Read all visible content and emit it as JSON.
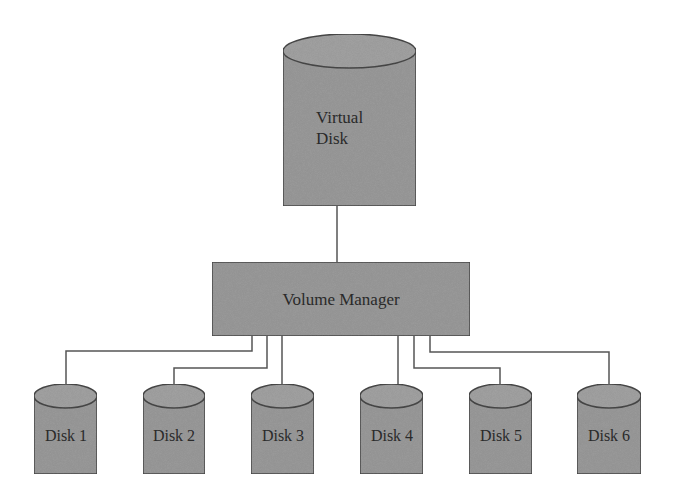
{
  "diagram": {
    "type": "storage-virtualization",
    "colors": {
      "fill": "#9c9c9c",
      "stroke": "#4a4a4a",
      "line": "#555555",
      "text": "#2a2a2a",
      "background": "#ffffff"
    },
    "virtual_disk": {
      "line1": "Virtual",
      "line2": "Disk"
    },
    "volume_manager": {
      "label": "Volume Manager"
    },
    "disks": [
      {
        "label": "Disk 1"
      },
      {
        "label": "Disk 2"
      },
      {
        "label": "Disk 3"
      },
      {
        "label": "Disk 4"
      },
      {
        "label": "Disk 5"
      },
      {
        "label": "Disk 6"
      }
    ],
    "edges": [
      {
        "from": "virtual_disk",
        "to": "volume_manager"
      },
      {
        "from": "volume_manager",
        "to": "Disk 1"
      },
      {
        "from": "volume_manager",
        "to": "Disk 2"
      },
      {
        "from": "volume_manager",
        "to": "Disk 3"
      },
      {
        "from": "volume_manager",
        "to": "Disk 4"
      },
      {
        "from": "volume_manager",
        "to": "Disk 5"
      },
      {
        "from": "volume_manager",
        "to": "Disk 6"
      }
    ]
  }
}
